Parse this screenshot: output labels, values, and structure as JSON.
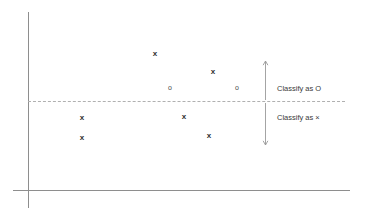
{
  "figure": {
    "title": "",
    "background_color": "#ffffff",
    "axis_color": "#8e8e8e",
    "boundary_color": "#b0b0b0",
    "marker_color": "#2f2f2f"
  },
  "axes": {
    "y_axis": {
      "name": "y-axis",
      "x": 28,
      "y_top": 12,
      "y_bottom": 208
    },
    "x_axis": {
      "name": "x-axis",
      "y": 190,
      "x_left": 13,
      "x_right": 350
    }
  },
  "decision_boundary": {
    "label": "decision-boundary",
    "style": "dashed",
    "y": 101,
    "x_start": 28,
    "x_end": 345
  },
  "annotations": [
    {
      "id": "classify-as-o",
      "text": "Classify as O",
      "arrow_direction": "up",
      "arrow_x": 265,
      "arrow_y_top": 61,
      "arrow_y_bottom": 100,
      "label_x": 277,
      "label_y": 84
    },
    {
      "id": "classify-as-x",
      "text": "Classify as ×",
      "arrow_direction": "down",
      "arrow_x": 265,
      "arrow_y_top": 103,
      "arrow_y_bottom": 145,
      "label_x": 277,
      "label_y": 113
    }
  ],
  "chart_data": {
    "type": "scatter",
    "title": "",
    "xlabel": "",
    "ylabel": "",
    "grid": false,
    "legend": false,
    "annotations": [
      "Classify as O",
      "Classify as ×"
    ],
    "decision_boundary_y": 101,
    "series": [
      {
        "name": "x",
        "marker": "x",
        "points": [
          {
            "x": 155,
            "y": 54
          },
          {
            "x": 213,
            "y": 72
          },
          {
            "x": 82,
            "y": 118
          },
          {
            "x": 184,
            "y": 117
          },
          {
            "x": 82,
            "y": 138
          },
          {
            "x": 209,
            "y": 136
          }
        ]
      },
      {
        "name": "o",
        "marker": "o",
        "points": [
          {
            "x": 170,
            "y": 88
          },
          {
            "x": 237,
            "y": 88
          }
        ]
      }
    ]
  }
}
